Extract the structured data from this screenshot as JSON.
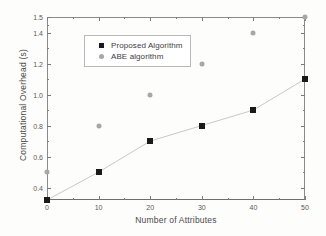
{
  "chart_data": {
    "type": "scatter",
    "title": "",
    "xlabel": "Number of Attributes",
    "ylabel": "Computational Overhead (s)",
    "xlim": [
      0,
      50
    ],
    "ylim": [
      0.32,
      1.5
    ],
    "grid": false,
    "legend_position": "upper-left-inside",
    "x": [
      0,
      10,
      20,
      30,
      40,
      50
    ],
    "xticks": [
      "0",
      "10",
      "20",
      "30",
      "40",
      "50"
    ],
    "xtick_values": [
      0,
      10,
      20,
      30,
      40,
      50
    ],
    "xminor_values": [
      5,
      15,
      25,
      35,
      45
    ],
    "yticks": [
      "0.4",
      "0.6",
      "0.8",
      "1.0",
      "1.2",
      "1.4",
      "1.5"
    ],
    "ytick_values": [
      0.4,
      0.6,
      0.8,
      1.0,
      1.2,
      1.4,
      1.5
    ],
    "yminor_values": [
      0.5,
      0.7,
      0.9,
      1.1,
      1.3,
      1.45
    ],
    "series": [
      {
        "name": "Proposed Algorithm",
        "marker": "filled-square",
        "color": "#1a1a1a",
        "has_trend_line": true,
        "values": [
          0.32,
          0.5,
          0.7,
          0.8,
          0.9,
          1.1
        ]
      },
      {
        "name": "ABE algorithm",
        "marker": "filled-circle",
        "color": "#a7a7a7",
        "has_trend_line": false,
        "values": [
          0.5,
          0.8,
          1.0,
          1.2,
          1.4,
          1.5
        ]
      }
    ]
  },
  "legend": {
    "entries": [
      {
        "label": "Proposed Algorithm"
      },
      {
        "label": "ABE algorithm"
      }
    ]
  },
  "colors": {
    "background": "#fdfdfc",
    "axis": "#8a8a8a",
    "proposed_marker": "#1a1a1a",
    "abe_marker": "#a7a7a7",
    "trend_line": "#c9c9c9",
    "text": "#4a4a4a"
  }
}
